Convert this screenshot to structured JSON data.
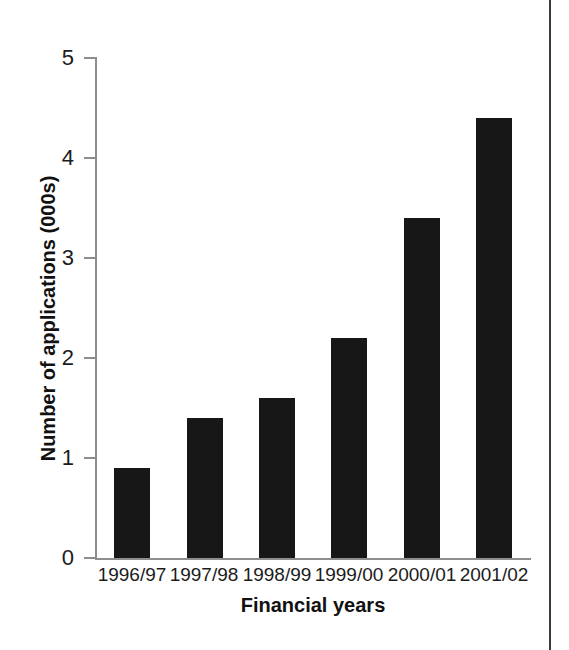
{
  "chart_data": {
    "type": "bar",
    "title": "",
    "xlabel": "Financial years",
    "ylabel": "Number of applications (000s)",
    "categories": [
      "1996/97",
      "1997/98",
      "1998/99",
      "1999/00",
      "2000/01",
      "2001/02"
    ],
    "values": [
      0.9,
      1.4,
      1.6,
      2.2,
      3.4,
      4.4
    ],
    "ylim": [
      0,
      5
    ],
    "yticks": [
      "0",
      "1",
      "2",
      "3",
      "4",
      "5"
    ],
    "ytick_values": [
      0,
      1,
      2,
      3,
      4,
      5
    ],
    "grid": false,
    "legend": false,
    "bar_color": "#171717",
    "axis_color": "#8e8e8e",
    "background": "#ffffff"
  },
  "page": {
    "border_color": "#3a3a3a"
  }
}
